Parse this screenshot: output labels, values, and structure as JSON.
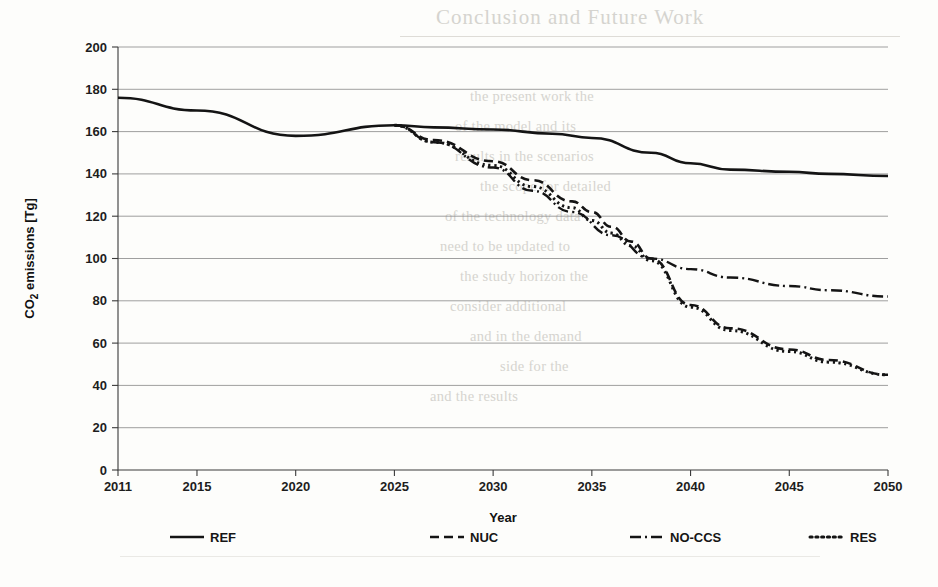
{
  "page": {
    "bleed_through_note": "faint mirrored text from reverse of scanned page",
    "bleed_heading": "Conclusion and Future Work",
    "bleed_lines": [
      "the present work the",
      "of the model and its",
      "results in the scenarios",
      "the scope for detailed",
      "of the technology data",
      "need to be updated to",
      "the study horizon the",
      "consider additional",
      "and in the demand",
      "side for the",
      "and the results"
    ]
  },
  "chart_data": {
    "type": "line",
    "title": "",
    "xlabel": "Year",
    "ylabel": "CO₂ emissions [Tg]",
    "xlim": [
      2011,
      2050
    ],
    "ylim": [
      0,
      200
    ],
    "ytick_step": 20,
    "yticks": [
      0,
      20,
      40,
      60,
      80,
      100,
      120,
      140,
      160,
      180,
      200
    ],
    "xticks": [
      2011,
      2015,
      2020,
      2025,
      2030,
      2035,
      2040,
      2045,
      2050
    ],
    "grid": "horizontal",
    "legend_position": "bottom",
    "line_color": "#141414",
    "series": [
      {
        "name": "REF",
        "style": "solid",
        "dasharray": "",
        "width": 2.6,
        "x": [
          2011,
          2015,
          2020,
          2025,
          2027,
          2030,
          2033,
          2035,
          2038,
          2040,
          2042,
          2045,
          2047,
          2050
        ],
        "values": [
          176,
          170,
          158,
          163,
          162,
          161,
          159,
          157,
          150,
          145,
          142,
          141,
          140,
          139
        ]
      },
      {
        "name": "NUC",
        "style": "dashed",
        "dasharray": "9,5",
        "width": 2.6,
        "x": [
          2025,
          2027,
          2030,
          2032,
          2034,
          2035,
          2036,
          2037,
          2038,
          2040,
          2042,
          2045,
          2047,
          2050
        ],
        "values": [
          163,
          156,
          146,
          137,
          127,
          122,
          115,
          108,
          100,
          78,
          67,
          57,
          52,
          45
        ]
      },
      {
        "name": "NO-CCS",
        "style": "dash-dot",
        "dasharray": "11,4,2,4",
        "width": 2.4,
        "x": [
          2025,
          2027,
          2030,
          2032,
          2034,
          2036,
          2038,
          2040,
          2042,
          2045,
          2047,
          2050
        ],
        "values": [
          163,
          155,
          143,
          132,
          122,
          111,
          100,
          95,
          91,
          87,
          85,
          82
        ]
      },
      {
        "name": "RES",
        "style": "dotted",
        "dasharray": "2.2,3.6",
        "width": 3.0,
        "x": [
          2025,
          2027,
          2030,
          2032,
          2034,
          2035,
          2036,
          2037,
          2038,
          2040,
          2042,
          2045,
          2047,
          2050
        ],
        "values": [
          163,
          155,
          144,
          134,
          124,
          118,
          112,
          106,
          99,
          77,
          66,
          56,
          51,
          45
        ]
      }
    ]
  },
  "legend": {
    "items": [
      {
        "label": "REF",
        "style": "solid"
      },
      {
        "label": "NUC",
        "style": "dashed"
      },
      {
        "label": "NO-CCS",
        "style": "dash-dot"
      },
      {
        "label": "RES",
        "style": "dotted"
      }
    ]
  }
}
